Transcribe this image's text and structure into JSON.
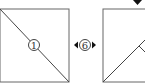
{
  "diagram": {
    "left_panel": {
      "step_label": "1"
    },
    "connector": {
      "step_label": "6",
      "left_arrow": "◀",
      "right_arrow": "▶"
    },
    "right_panel": {
      "marker": "▼"
    }
  },
  "colors": {
    "stroke": "#555555",
    "fill": "#000000"
  }
}
